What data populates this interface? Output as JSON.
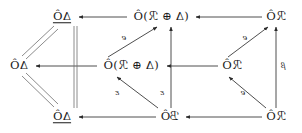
{
  "figure": {
    "kind": "commutative-diagram",
    "orientation": "horizontally-mirrored",
    "background": "#ffffff",
    "ink": "#1a1a1a"
  },
  "nodes": [
    {
      "id": "n00",
      "row": 0,
      "col": 0,
      "x": 62,
      "y": 17,
      "text": "ΔÔ",
      "underline_head": "Δ",
      "tail": "Ô",
      "underlined": true
    },
    {
      "id": "n01",
      "row": 0,
      "col": 1,
      "x": 161,
      "y": 17,
      "text": "(Δ ⊕ ℛ)Ô",
      "underline_head": "Δ",
      "tail": " ⊕ ℛ)Ô",
      "underlined": true,
      "open_paren": "("
    },
    {
      "id": "n02",
      "row": 0,
      "col": 2,
      "x": 276,
      "y": 17,
      "text": "ℛÔ",
      "underline_head": "",
      "tail": "ℛÔ",
      "underlined": false
    },
    {
      "id": "n10",
      "row": 1,
      "col": 0,
      "x": 19,
      "y": 66,
      "text": "ΔÔ",
      "underline_head": "",
      "tail": "ΔÔ",
      "underlined": false
    },
    {
      "id": "n11",
      "row": 1,
      "col": 1,
      "x": 131,
      "y": 66,
      "text": "(Δ ⊕ ℛ)Ô",
      "underline_head": "Δ",
      "tail": " ⊕ ℛ)Ô",
      "underlined": true,
      "open_paren": "("
    },
    {
      "id": "n12",
      "row": 1,
      "col": 2,
      "x": 232,
      "y": 66,
      "text": "ℛÔ",
      "underline_head": "",
      "tail": "ℛÔ",
      "underlined": false
    },
    {
      "id": "n20",
      "row": 2,
      "col": 0,
      "x": 62,
      "y": 117,
      "text": "ΔÔ",
      "underline_head": "Δ",
      "tail": "Ô",
      "underlined": true
    },
    {
      "id": "n21",
      "row": 2,
      "col": 1,
      "x": 170,
      "y": 117,
      "text": "ℬÔ",
      "underline_head": "",
      "tail": "ℬÔ",
      "underlined": false
    },
    {
      "id": "n22",
      "row": 2,
      "col": 2,
      "x": 276,
      "y": 117,
      "text": "ℛÔ",
      "underline_head": "",
      "tail": "ℛÔ",
      "underlined": false
    }
  ],
  "edges": [
    {
      "id": "e-top-right",
      "from": "n02",
      "to": "n01",
      "kind": "arrow",
      "direction": "leftward",
      "label": ""
    },
    {
      "id": "e-top-left",
      "from": "n01",
      "to": "n00",
      "kind": "arrow",
      "direction": "leftward",
      "label": ""
    },
    {
      "id": "e-mid-right",
      "from": "n12",
      "to": "n11",
      "kind": "arrow",
      "direction": "leftward",
      "label": ""
    },
    {
      "id": "e-mid-left",
      "from": "n11",
      "to": "n10",
      "kind": "arrow",
      "direction": "leftward",
      "label": ""
    },
    {
      "id": "e-bot-right",
      "from": "n22",
      "to": "n21",
      "kind": "arrow",
      "direction": "leftward",
      "label": ""
    },
    {
      "id": "e-bot-left",
      "from": "n21",
      "to": "n20",
      "kind": "arrow",
      "direction": "leftward",
      "label": ""
    },
    {
      "id": "e-col1-vert",
      "from": "n21",
      "to": "n01",
      "kind": "arrow",
      "direction": "upward",
      "label": "ε"
    },
    {
      "id": "e-col2-vert",
      "from": "n22",
      "to": "n02",
      "kind": "arrow",
      "direction": "upward",
      "label": "β"
    },
    {
      "id": "e-diag-upper-c",
      "from": "n11",
      "to": "n01",
      "kind": "arrow",
      "direction": "up-right",
      "label": "e"
    },
    {
      "id": "e-diag-upper-r",
      "from": "n12",
      "to": "n02",
      "kind": "arrow",
      "direction": "up-right",
      "label": "e"
    },
    {
      "id": "e-diag-lower-c",
      "from": "n21",
      "to": "n11",
      "kind": "arrow",
      "direction": "up-left",
      "label": "ε"
    },
    {
      "id": "e-diag-lower-r",
      "from": "n22",
      "to": "n12",
      "kind": "arrow",
      "direction": "up-left",
      "label": "e"
    },
    {
      "id": "e-eq-upper",
      "from": "n00",
      "to": "n10",
      "kind": "double-equals",
      "direction": "none",
      "label": ""
    },
    {
      "id": "e-eq-lower",
      "from": "n10",
      "to": "n20",
      "kind": "double-equals",
      "direction": "none",
      "label": ""
    },
    {
      "id": "e-eq-vert",
      "from": "n00",
      "to": "n20",
      "kind": "double-equals",
      "direction": "none",
      "label": ""
    }
  ],
  "edge_labels": [
    {
      "id": "lbl-e-upper-center",
      "text": "e",
      "x": 124,
      "y": 38
    },
    {
      "id": "lbl-e-upper-right",
      "text": "e",
      "x": 245,
      "y": 38
    },
    {
      "id": "lbl-eps-lower-left",
      "text": "ε",
      "x": 117,
      "y": 93
    },
    {
      "id": "lbl-eps-col1",
      "text": "ε",
      "x": 162,
      "y": 93
    },
    {
      "id": "lbl-e-lower-right",
      "text": "e",
      "x": 243,
      "y": 93
    },
    {
      "id": "lbl-beta-col2",
      "text": "β",
      "x": 283,
      "y": 66
    }
  ]
}
